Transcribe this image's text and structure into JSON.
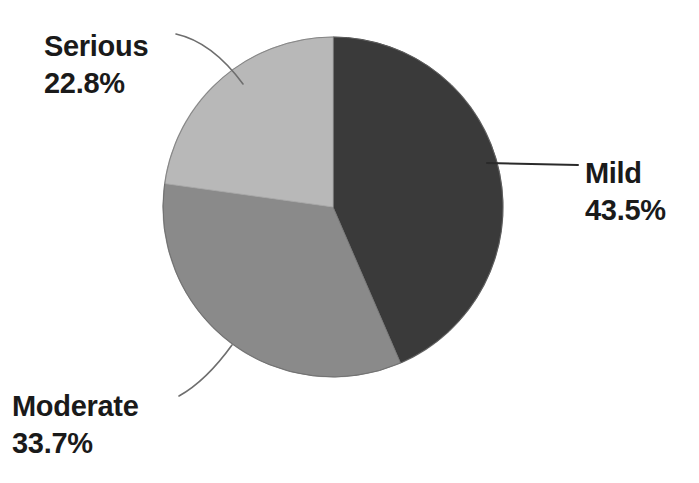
{
  "chart_data": {
    "type": "pie",
    "title": "",
    "subtitle": "",
    "xlabel": "",
    "ylabel": "",
    "legend_position": "none",
    "grid": false,
    "units": "percent",
    "start_angle_deg": 0,
    "direction": "clockwise",
    "categories": [
      "Mild",
      "Moderate",
      "Serious"
    ],
    "values": [
      43.5,
      33.7,
      22.8
    ],
    "labels": [
      "43.5%",
      "33.7%",
      "22.8%"
    ],
    "colors": [
      "#3a3a3a",
      "#8a8a8a",
      "#b8b8b8"
    ],
    "slices": [
      {
        "name": "Mild",
        "value": 43.5,
        "label": "43.5%",
        "color": "#3a3a3a"
      },
      {
        "name": "Moderate",
        "value": 33.7,
        "label": "33.7%",
        "color": "#8a8a8a"
      },
      {
        "name": "Serious",
        "value": 22.8,
        "label": "22.8%",
        "color": "#b8b8b8"
      }
    ]
  },
  "chart": {
    "background_color": "#ffffff",
    "outline_color": "#5a5a5a",
    "leader_line_color": "#6e6e6e",
    "center_x": 333,
    "center_y": 207,
    "radius": 170
  },
  "labels": {
    "serious": {
      "name": "Serious",
      "value": "22.8%"
    },
    "mild": {
      "name": "Mild",
      "value": "43.5%"
    },
    "moderate": {
      "name": "Moderate",
      "value": "33.7%"
    }
  }
}
